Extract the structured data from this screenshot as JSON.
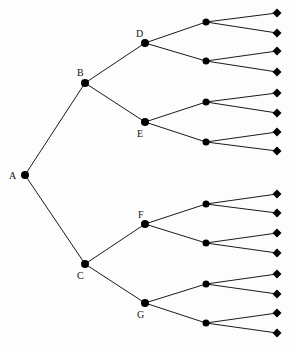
{
  "diagram": {
    "type": "tree",
    "orientation": "left-to-right",
    "colors": {
      "line": "#1a1a1a",
      "node": "#000000",
      "background": "#fdfdfd"
    },
    "nodes": [
      {
        "id": "A",
        "label": "A",
        "x": 25,
        "y": 175,
        "lx": 9,
        "ly": 179
      },
      {
        "id": "B",
        "label": "B",
        "x": 85,
        "y": 83,
        "lx": 77,
        "ly": 76
      },
      {
        "id": "C",
        "label": "C",
        "x": 85,
        "y": 264,
        "lx": 77,
        "ly": 279
      },
      {
        "id": "D",
        "label": "D",
        "x": 145,
        "y": 43,
        "lx": 136,
        "ly": 37
      },
      {
        "id": "E",
        "label": "E",
        "x": 145,
        "y": 122,
        "lx": 137,
        "ly": 137
      },
      {
        "id": "F",
        "label": "F",
        "x": 145,
        "y": 224,
        "lx": 138,
        "ly": 218
      },
      {
        "id": "G",
        "label": "G",
        "x": 145,
        "y": 303,
        "lx": 137,
        "ly": 318
      }
    ],
    "level3": [
      {
        "parent": "D",
        "x": 206,
        "y": 22
      },
      {
        "parent": "D",
        "x": 206,
        "y": 61
      },
      {
        "parent": "E",
        "x": 206,
        "y": 102
      },
      {
        "parent": "E",
        "x": 206,
        "y": 142
      },
      {
        "parent": "F",
        "x": 206,
        "y": 204
      },
      {
        "parent": "F",
        "x": 206,
        "y": 243
      },
      {
        "parent": "G",
        "x": 206,
        "y": 284
      },
      {
        "parent": "G",
        "x": 206,
        "y": 323
      }
    ],
    "leaves": [
      {
        "parent": 0,
        "x": 277,
        "y": 13
      },
      {
        "parent": 0,
        "x": 277,
        "y": 33
      },
      {
        "parent": 1,
        "x": 277,
        "y": 51
      },
      {
        "parent": 1,
        "x": 277,
        "y": 72
      },
      {
        "parent": 2,
        "x": 277,
        "y": 93
      },
      {
        "parent": 2,
        "x": 277,
        "y": 113
      },
      {
        "parent": 3,
        "x": 277,
        "y": 132
      },
      {
        "parent": 3,
        "x": 277,
        "y": 151
      },
      {
        "parent": 4,
        "x": 277,
        "y": 194
      },
      {
        "parent": 4,
        "x": 277,
        "y": 213
      },
      {
        "parent": 5,
        "x": 277,
        "y": 233
      },
      {
        "parent": 5,
        "x": 277,
        "y": 253
      },
      {
        "parent": 6,
        "x": 277,
        "y": 274
      },
      {
        "parent": 6,
        "x": 277,
        "y": 294
      },
      {
        "parent": 7,
        "x": 277,
        "y": 313
      },
      {
        "parent": 7,
        "x": 277,
        "y": 333
      }
    ],
    "edges": [
      [
        "A",
        "B"
      ],
      [
        "A",
        "C"
      ],
      [
        "B",
        "D"
      ],
      [
        "B",
        "E"
      ],
      [
        "C",
        "F"
      ],
      [
        "C",
        "G"
      ]
    ]
  }
}
